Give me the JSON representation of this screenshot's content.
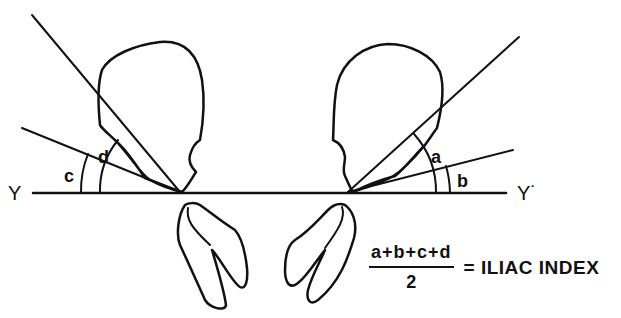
{
  "diagram": {
    "baseline": {
      "left_label": "Y",
      "right_label": "Y˙"
    },
    "angles": {
      "a": "a",
      "b": "b",
      "c": "c",
      "d": "d"
    },
    "formula": {
      "numerator": "a+b+c+d",
      "denominator": "2",
      "result": "= ILIAC INDEX"
    },
    "colors": {
      "stroke": "#111111",
      "background": "#ffffff"
    }
  }
}
